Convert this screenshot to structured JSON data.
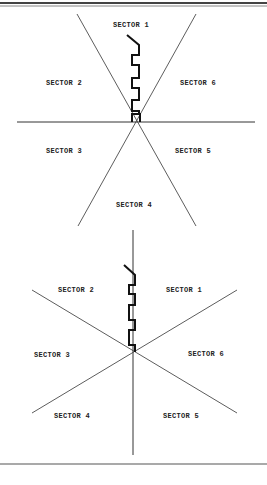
{
  "figures": [
    {
      "name": "top-sector-diagram",
      "sectors": [
        {
          "label": "SECTOR  1",
          "x": 113,
          "y": 27
        },
        {
          "label": "SECTOR 2",
          "x": 46,
          "y": 85
        },
        {
          "label": "SECTOR 6",
          "x": 180,
          "y": 85
        },
        {
          "label": "SECTOR 3",
          "x": 46,
          "y": 153
        },
        {
          "label": "SECTOR 5",
          "x": 175,
          "y": 153
        },
        {
          "label": "SECTOR 4",
          "x": 116,
          "y": 207
        }
      ]
    },
    {
      "name": "bottom-sector-diagram",
      "sectors": [
        {
          "label": "SECTOR 2",
          "x": 58,
          "y": 292
        },
        {
          "label": "SECTOR 1",
          "x": 166,
          "y": 292
        },
        {
          "label": "SECTOR 3",
          "x": 34,
          "y": 357
        },
        {
          "label": "SECTOR 6",
          "x": 188,
          "y": 356
        },
        {
          "label": "SECTOR 4",
          "x": 54,
          "y": 418
        },
        {
          "label": "SECTOR 5",
          "x": 163,
          "y": 418
        }
      ]
    }
  ],
  "colors": {
    "line": "#333333",
    "path": "#111111",
    "border": "#555555"
  }
}
